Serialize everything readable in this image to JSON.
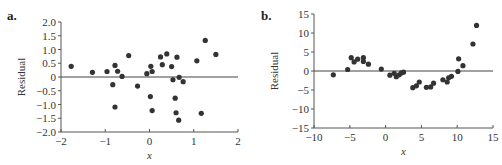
{
  "chart_data": [
    {
      "panel": "a.",
      "type": "scatter",
      "title": "",
      "xlabel": "x",
      "ylabel": "Residual",
      "xlim": [
        -2,
        2
      ],
      "ylim": [
        -2.0,
        2.0
      ],
      "xticks": [
        -2,
        -1,
        0,
        1,
        2
      ],
      "xtick_labels": [
        "−2",
        "−1",
        "0",
        "1",
        "2"
      ],
      "yticks": [
        2.0,
        1.5,
        1.0,
        0.5,
        0,
        -0.5,
        -1.0,
        -1.5,
        -2.0
      ],
      "ytick_labels": [
        "2.0",
        "1.5",
        "1.0",
        "0.5",
        "0",
        "−0.5",
        "−1.0",
        "−1.5",
        "−2.0"
      ],
      "reference_line_y": 0,
      "grid": false,
      "legend": null,
      "point_color": "#333333",
      "x": [
        -1.77,
        -1.29,
        -0.96,
        -0.78,
        -0.72,
        -0.62,
        -0.83,
        -0.78,
        -0.47,
        -0.27,
        -0.06,
        0.03,
        0.06,
        0.02,
        0.06,
        0.25,
        0.39,
        0.29,
        0.5,
        0.62,
        0.53,
        0.67,
        0.76,
        0.58,
        0.6,
        0.66,
        1.07,
        1.17,
        1.26,
        1.5
      ],
      "y": [
        0.39,
        0.17,
        0.2,
        0.42,
        0.21,
        0.02,
        -0.28,
        -1.09,
        0.78,
        -0.33,
        0.12,
        0.39,
        0.2,
        -0.71,
        -1.22,
        0.73,
        0.84,
        0.45,
        0.38,
        0.72,
        -0.1,
        -0.01,
        -0.17,
        -0.77,
        -1.3,
        -1.57,
        0.59,
        -1.32,
        1.33,
        0.82
      ]
    },
    {
      "panel": "b.",
      "type": "scatter",
      "title": "",
      "xlabel": "x",
      "ylabel": "Residual",
      "xlim": [
        -10,
        15
      ],
      "ylim": [
        -15,
        15
      ],
      "xticks": [
        -10,
        -5,
        0,
        5,
        10,
        15
      ],
      "xtick_labels": [
        "−10",
        "−5",
        "0",
        "5",
        "10",
        "15"
      ],
      "yticks": [
        15,
        10,
        5,
        0,
        -5,
        -10,
        -15
      ],
      "ytick_labels": [
        "15",
        "10",
        "5",
        "0",
        "−5",
        "−10",
        "−15"
      ],
      "reference_line_y": 0,
      "grid": false,
      "legend": null,
      "point_color": "#333333",
      "x": [
        -7.3,
        -5.3,
        -4.8,
        -4.4,
        -3.9,
        -3.1,
        -3.1,
        -2.4,
        -0.6,
        0.6,
        1.2,
        1.5,
        1.9,
        2.2,
        2.5,
        3.8,
        4.3,
        4.7,
        5.7,
        6.3,
        6.7,
        8.0,
        8.6,
        8.8,
        9.2,
        10.1,
        10.2,
        10.8,
        12.2,
        12.7
      ],
      "y": [
        -1.0,
        0.4,
        3.5,
        2.4,
        3.1,
        3.5,
        2.5,
        1.8,
        0.5,
        -1.1,
        -0.6,
        -1.5,
        -1.0,
        -0.5,
        -0.3,
        -4.4,
        -3.9,
        -2.9,
        -4.3,
        -4.2,
        -3.2,
        -2.3,
        -2.9,
        -1.8,
        -1.4,
        -0.1,
        3.2,
        1.4,
        7.1,
        12.0
      ]
    }
  ],
  "panels": {
    "a": {
      "label": "a.",
      "ylabel": "Residual",
      "xlabel": "x"
    },
    "b": {
      "label": "b.",
      "ylabel": "Residual",
      "xlabel": "x"
    }
  }
}
